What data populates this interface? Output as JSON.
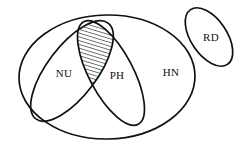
{
  "diagram": {
    "type": "venn-ellipse-diagram",
    "background_color": "#ffffff",
    "stroke_color": "#111111",
    "hatch_color": "#111111",
    "regions": [
      {
        "id": "hn",
        "label": "HN",
        "shape": "ellipse",
        "role": "outer-universe",
        "cx": 107,
        "cy": 77,
        "rx": 88,
        "ry": 62,
        "rotation": -1,
        "stroke_width": 1.7,
        "fill": "none",
        "label_x": 171,
        "label_y": 73
      },
      {
        "id": "nu",
        "label": "NU",
        "shape": "ellipse",
        "role": "subset",
        "cx": 72,
        "cy": 71,
        "rx": 60,
        "ry": 25,
        "rotation": -53,
        "stroke_width": 1.7,
        "fill": "none",
        "label_x": 64,
        "label_y": 74
      },
      {
        "id": "ph",
        "label": "PH",
        "shape": "ellipse",
        "role": "subset",
        "cx": 111,
        "cy": 73,
        "rx": 58,
        "ry": 22,
        "rotation": 62,
        "stroke_width": 1.7,
        "fill": "none",
        "label_x": 117,
        "label_y": 76
      },
      {
        "id": "rd",
        "label": "RD",
        "shape": "ellipse",
        "role": "disjoint",
        "cx": 209,
        "cy": 37,
        "rx": 33,
        "ry": 18,
        "rotation": 56,
        "stroke_width": 1.7,
        "fill": "none",
        "label_x": 211,
        "label_y": 38
      }
    ],
    "intersection": {
      "id": "nu-ph-overlap",
      "label": "",
      "between": [
        "nu",
        "ph"
      ],
      "fill_pattern": "diagonal-hatch",
      "hatch_angle_deg": 45,
      "hatch_spacing_px": 3.6,
      "stroke_width": 1.7,
      "bounds": {
        "x": 81,
        "y": 17,
        "width": 23,
        "height": 47
      }
    },
    "labels": [
      {
        "id": "label-nu",
        "text": "NU"
      },
      {
        "id": "label-ph",
        "text": "PH"
      },
      {
        "id": "label-hn",
        "text": "HN"
      },
      {
        "id": "label-rd",
        "text": "RD"
      }
    ]
  }
}
